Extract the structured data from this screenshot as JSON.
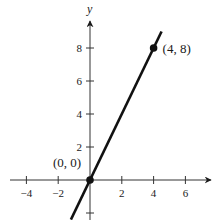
{
  "chart_data": {
    "type": "line",
    "title": "",
    "xlabel": "",
    "ylabel": "y",
    "xlim": [
      -5.2,
      7.5
    ],
    "ylim": [
      -2.4,
      9.7
    ],
    "grid": false,
    "legend": null,
    "x_ticks": [
      -4,
      -2,
      2,
      4,
      6
    ],
    "x_tick_labels": [
      "−4",
      "−2",
      "2",
      "4",
      "6"
    ],
    "y_ticks": [
      -2,
      2,
      4,
      6,
      8
    ],
    "y_tick_labels": [
      "",
      "2",
      "4",
      "6",
      "8"
    ],
    "series": [
      {
        "name": "y = 2x",
        "x": [
          -1.2,
          4.5
        ],
        "y": [
          -2.4,
          9.0
        ],
        "color": "#111111"
      }
    ],
    "points": [
      {
        "x": 0,
        "y": 0,
        "label": "(0, 0)"
      },
      {
        "x": 4,
        "y": 8,
        "label": "(4, 8)"
      }
    ]
  },
  "colors": {
    "line": "#111111",
    "axis": "#333333",
    "text": "#1a1a1a",
    "background": "#ffffff"
  }
}
